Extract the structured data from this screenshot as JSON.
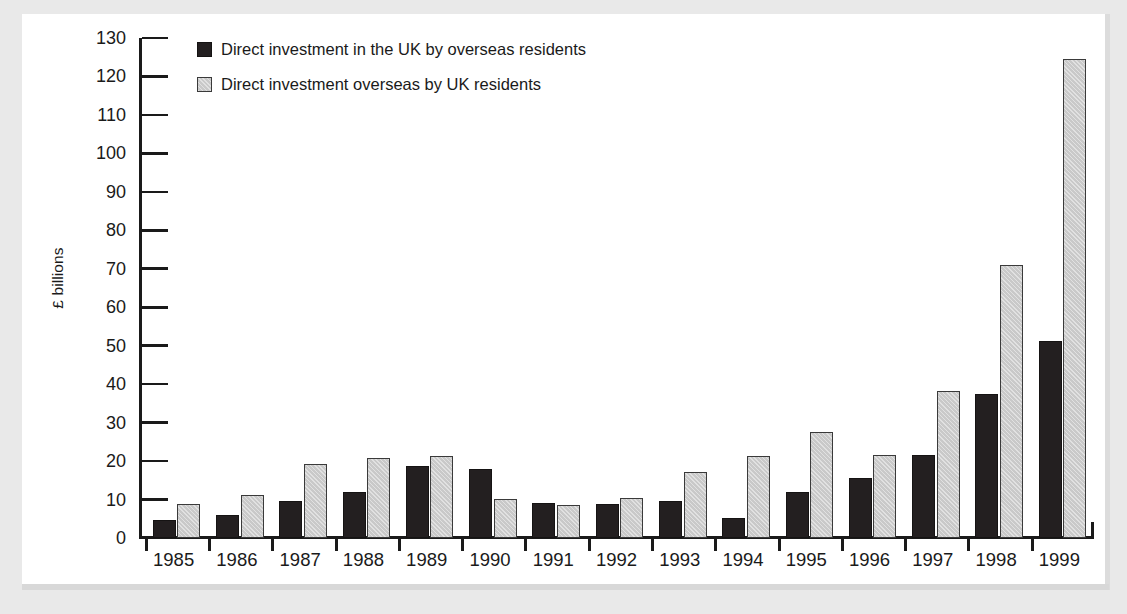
{
  "chart_data": {
    "type": "bar",
    "title": "",
    "xlabel": "",
    "ylabel": "£ billions",
    "ylim": [
      0,
      130
    ],
    "ytick_step": 10,
    "yticks": [
      0,
      10,
      20,
      30,
      40,
      50,
      60,
      70,
      80,
      90,
      100,
      110,
      120,
      130
    ],
    "ytick_labels": [
      "0",
      "10",
      "20",
      "30",
      "40",
      "50",
      "60",
      "70",
      "80",
      "90",
      "100",
      "110",
      "120",
      "130"
    ],
    "categories": [
      "1985",
      "1986",
      "1987",
      "1988",
      "1989",
      "1990",
      "1991",
      "1992",
      "1993",
      "1994",
      "1995",
      "1996",
      "1997",
      "1998",
      "1999"
    ],
    "grid": false,
    "legend_position": "top-left",
    "series": [
      {
        "name": "Direct investment in the UK by overseas residents",
        "color": "#231f20",
        "style": "solid-dark",
        "values": [
          4.8,
          5.9,
          9.7,
          12.0,
          18.7,
          18.0,
          9.0,
          8.8,
          9.7,
          5.3,
          12.0,
          15.7,
          21.5,
          37.5,
          51.3
        ]
      },
      {
        "name": "Direct investment overseas by UK residents",
        "color": "#c9c9c9",
        "style": "hatched-light",
        "values": [
          8.8,
          11.3,
          19.3,
          20.8,
          21.4,
          10.1,
          8.7,
          10.3,
          17.1,
          21.4,
          27.5,
          21.7,
          38.2,
          71.0,
          124.5
        ]
      }
    ]
  },
  "legend": {
    "items": [
      {
        "label": "Direct investment in the UK by overseas residents",
        "swatch": "dark"
      },
      {
        "label": "Direct investment overseas by UK residents",
        "swatch": "light"
      }
    ]
  },
  "axes": {
    "y_title": "£ billions"
  }
}
